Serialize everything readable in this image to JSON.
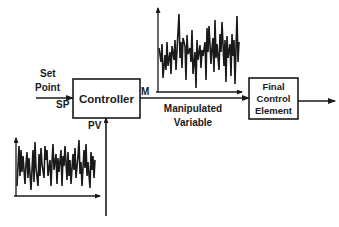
{
  "diagram": {
    "colors": {
      "stroke": "#1a1a1a",
      "background": "#ffffff"
    },
    "blocks": [
      {
        "id": "controller",
        "label": "Controller"
      },
      {
        "id": "final_control_element",
        "label_lines": [
          "Final",
          "Control",
          "Element"
        ]
      }
    ],
    "labels": {
      "set_point_line1": "Set",
      "set_point_line2": "Point",
      "sp": "SP",
      "pv": "PV",
      "m": "M",
      "manipulated_line1": "Manipulated",
      "manipulated_line2": "Variable"
    },
    "connections": [
      {
        "from": "set_point",
        "to": "controller",
        "label": "SP"
      },
      {
        "from": "controller",
        "to": "final_control_element",
        "label": "M"
      },
      {
        "from": "process_variable",
        "to": "controller",
        "label": "PV"
      },
      {
        "from": "final_control_element",
        "to": "output"
      }
    ],
    "signal_plots": [
      {
        "id": "manipulated-variable-plot",
        "description": "noisy time-series of M"
      },
      {
        "id": "process-variable-plot",
        "description": "noisy time-series of PV"
      }
    ]
  }
}
